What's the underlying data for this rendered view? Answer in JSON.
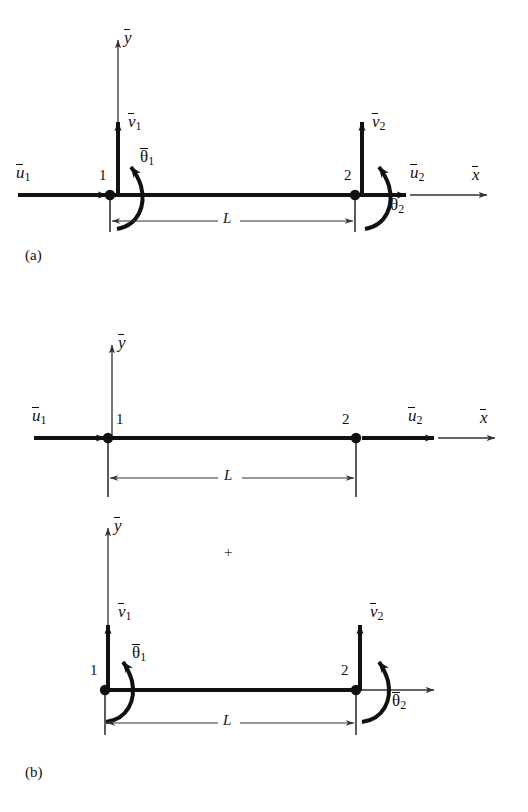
{
  "figure": {
    "type": "engineering-diagram",
    "background_color": "#ffffff",
    "ink_color": "#111111",
    "panels": [
      {
        "id": "a",
        "label": "(a)",
        "caption_position": "bottom-left",
        "shows": "combined beam element with axial, transverse and rotational degrees of freedom",
        "axes": {
          "x_label": "x",
          "y_label": "y",
          "overbar": true
        },
        "nodes": [
          {
            "id": "1",
            "label": "1"
          },
          {
            "id": "2",
            "label": "2"
          }
        ],
        "dimension": {
          "label": "L",
          "between": [
            "1",
            "2"
          ]
        },
        "dofs": [
          {
            "name": "u1",
            "base": "u",
            "sub": "1",
            "kind": "axial",
            "direction": "right",
            "node": "1"
          },
          {
            "name": "v1",
            "base": "v",
            "sub": "1",
            "kind": "transverse",
            "direction": "up",
            "node": "1"
          },
          {
            "name": "theta1",
            "base": "θ",
            "sub": "1",
            "kind": "rotation",
            "direction": "counterclockwise",
            "node": "1"
          },
          {
            "name": "u2",
            "base": "u",
            "sub": "2",
            "kind": "axial",
            "direction": "right",
            "node": "2"
          },
          {
            "name": "v2",
            "base": "v",
            "sub": "2",
            "kind": "transverse",
            "direction": "up",
            "node": "2"
          },
          {
            "name": "theta2",
            "base": "θ",
            "sub": "2",
            "kind": "rotation",
            "direction": "counterclockwise",
            "node": "2"
          }
        ]
      },
      {
        "id": "b",
        "label": "(b)",
        "caption_position": "bottom-left",
        "shows": "superposition of axial (bar) behavior plus bending (beam) behavior",
        "operator": "+",
        "subpanels": [
          {
            "id": "b-axial",
            "shows": "axial degrees of freedom only",
            "axes": {
              "x_label": "x",
              "y_label": "y",
              "overbar": true
            },
            "nodes": [
              {
                "id": "1",
                "label": "1"
              },
              {
                "id": "2",
                "label": "2"
              }
            ],
            "dimension": {
              "label": "L",
              "between": [
                "1",
                "2"
              ]
            },
            "dofs": [
              {
                "name": "u1",
                "base": "u",
                "sub": "1",
                "kind": "axial",
                "direction": "right",
                "node": "1"
              },
              {
                "name": "u2",
                "base": "u",
                "sub": "2",
                "kind": "axial",
                "direction": "right",
                "node": "2"
              }
            ]
          },
          {
            "id": "b-bending",
            "shows": "transverse and rotational degrees of freedom only",
            "axes": {
              "x_label": "",
              "y_label": "y",
              "overbar": true
            },
            "nodes": [
              {
                "id": "1",
                "label": "1"
              },
              {
                "id": "2",
                "label": "2"
              }
            ],
            "dimension": {
              "label": "L",
              "between": [
                "1",
                "2"
              ]
            },
            "dofs": [
              {
                "name": "v1",
                "base": "v",
                "sub": "1",
                "kind": "transverse",
                "direction": "up",
                "node": "1"
              },
              {
                "name": "theta1",
                "base": "θ",
                "sub": "1",
                "kind": "rotation",
                "direction": "counterclockwise",
                "node": "1"
              },
              {
                "name": "v2",
                "base": "v",
                "sub": "2",
                "kind": "transverse",
                "direction": "up",
                "node": "2"
              },
              {
                "name": "theta2",
                "base": "θ",
                "sub": "2",
                "kind": "rotation",
                "direction": "counterclockwise",
                "node": "2"
              }
            ]
          }
        ]
      }
    ],
    "symbols": {
      "u": "u",
      "v": "v",
      "theta": "θ",
      "x": "x",
      "y": "y",
      "L": "L",
      "plus": "+",
      "node_1": "1",
      "node_2": "2",
      "sub_1": "1",
      "sub_2": "2",
      "panel_a": "(a)",
      "panel_b": "(b)"
    }
  }
}
